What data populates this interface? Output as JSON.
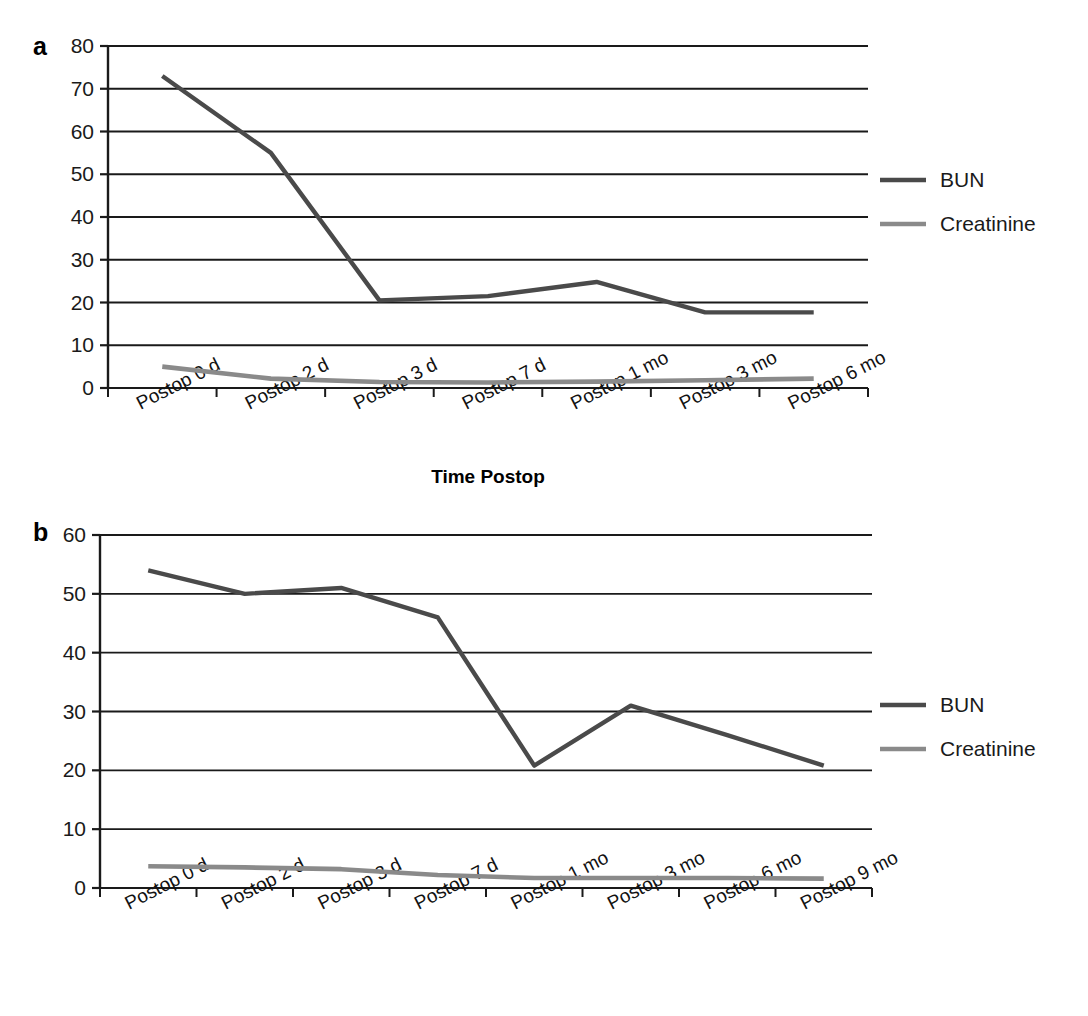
{
  "figure": {
    "caption": ""
  },
  "panels": [
    {
      "letter": "a",
      "xlabel": "Time Postop",
      "legend": [
        {
          "label": "BUN",
          "color": "#4a4a4a"
        },
        {
          "label": "Creatinine",
          "color": "#8a8a8a"
        }
      ],
      "yticks": [
        "0",
        "10",
        "20",
        "30",
        "40",
        "50",
        "60",
        "70",
        "80"
      ],
      "xticks": [
        "Postop 0 d",
        "Postop 2 d",
        "Postop 3 d",
        "Postop 7 d",
        "Postop 1 mo",
        "Postop 3 mo",
        "Postop 6 mo"
      ]
    },
    {
      "letter": "b",
      "xlabel": "",
      "legend": [
        {
          "label": "BUN",
          "color": "#4a4a4a"
        },
        {
          "label": "Creatinine",
          "color": "#8a8a8a"
        }
      ],
      "yticks": [
        "0",
        "10",
        "20",
        "30",
        "40",
        "50",
        "60"
      ],
      "xticks": [
        "Postop 0 d",
        "Postop 2 d",
        "Postop 3 d",
        "Postop 7 d",
        "Postop 1 mo",
        "Postop 3 mo",
        "Postop 6 mo",
        "Postop 9 mo"
      ]
    }
  ],
  "chart_data": [
    {
      "type": "line",
      "panel": "a",
      "title": "",
      "xlabel": "Time Postop",
      "ylabel": "",
      "ylim": [
        0,
        80
      ],
      "ytick_step": 10,
      "grid": true,
      "legend_position": "right",
      "categories": [
        "Postop 0 d",
        "Postop 2 d",
        "Postop 3 d",
        "Postop 7 d",
        "Postop 1 mo",
        "Postop 3 mo",
        "Postop 6 mo"
      ],
      "series": [
        {
          "name": "BUN",
          "color": "#4a4a4a",
          "values": [
            73,
            55,
            20.5,
            21.5,
            24.8,
            17.7,
            17.7
          ]
        },
        {
          "name": "Creatinine",
          "color": "#8a8a8a",
          "values": [
            5.0,
            2.2,
            1.4,
            1.3,
            1.5,
            1.8,
            2.2
          ]
        }
      ]
    },
    {
      "type": "line",
      "panel": "b",
      "title": "",
      "xlabel": "",
      "ylabel": "",
      "ylim": [
        0,
        60
      ],
      "ytick_step": 10,
      "grid": true,
      "legend_position": "right",
      "categories": [
        "Postop 0 d",
        "Postop 2 d",
        "Postop 3 d",
        "Postop 7 d",
        "Postop 1 mo",
        "Postop 3 mo",
        "Postop 6 mo",
        "Postop 9 mo"
      ],
      "series": [
        {
          "name": "BUN",
          "color": "#4a4a4a",
          "values": [
            54,
            50,
            51,
            46,
            20.8,
            31,
            26,
            20.8
          ]
        },
        {
          "name": "Creatinine",
          "color": "#8a8a8a",
          "values": [
            3.7,
            3.5,
            3.2,
            2.2,
            1.7,
            1.7,
            1.7,
            1.6
          ]
        }
      ]
    }
  ]
}
